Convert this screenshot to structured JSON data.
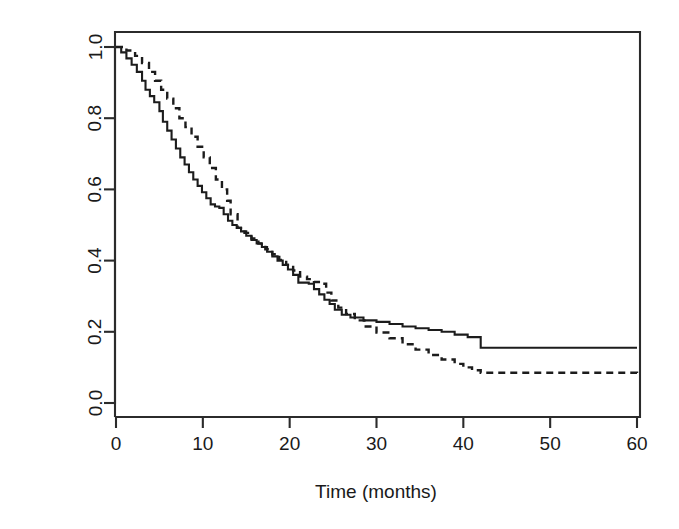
{
  "figure": {
    "background_color": "#ffffff",
    "foreground_color": "#1a1a1a"
  },
  "chart_data": {
    "type": "line",
    "subtype": "kaplan-meier-step",
    "title": "",
    "subtitle": "",
    "xlabel": "Time (months)",
    "ylabel": "Survival",
    "xlim": [
      0,
      60
    ],
    "ylim": [
      0.0,
      1.0
    ],
    "xticks": [
      0,
      10,
      20,
      30,
      40,
      50,
      60
    ],
    "xticklabels": [
      "0",
      "10",
      "20",
      "30",
      "40",
      "50",
      "60"
    ],
    "yticks": [
      0.0,
      0.2,
      0.4,
      0.6,
      0.8,
      1.0
    ],
    "yticklabels": [
      "0.0",
      "0.2",
      "0.4",
      "0.6",
      "0.8",
      "1.0"
    ],
    "grid": false,
    "legend": false,
    "legend_position": "none",
    "frame": "box",
    "series": [
      {
        "name": "Group 1",
        "style": "solid",
        "color": "#1c1c1c",
        "x": [
          0,
          0.6,
          1.2,
          1.8,
          2.4,
          3.0,
          3.4,
          3.9,
          4.4,
          5.0,
          5.4,
          5.9,
          6.4,
          6.9,
          7.4,
          7.9,
          8.4,
          8.9,
          9.4,
          9.9,
          10.4,
          10.9,
          11.4,
          11.9,
          12.4,
          12.9,
          13.4,
          13.9,
          14.4,
          15.0,
          15.6,
          16.2,
          16.8,
          17.4,
          18.0,
          18.6,
          19.2,
          19.8,
          20.4,
          21.0,
          22.2,
          22.8,
          23.4,
          24.0,
          24.6,
          25.2,
          26.0,
          27.0,
          28.5,
          30.0,
          31.5,
          33.0,
          34.5,
          36.0,
          37.5,
          39.0,
          40.5,
          42.0,
          60.0
        ],
        "y": [
          1.0,
          0.985,
          0.968,
          0.95,
          0.93,
          0.905,
          0.88,
          0.862,
          0.845,
          0.82,
          0.79,
          0.765,
          0.74,
          0.715,
          0.69,
          0.67,
          0.648,
          0.628,
          0.61,
          0.592,
          0.575,
          0.558,
          0.552,
          0.548,
          0.53,
          0.512,
          0.5,
          0.492,
          0.482,
          0.47,
          0.458,
          0.448,
          0.438,
          0.425,
          0.412,
          0.4,
          0.388,
          0.375,
          0.36,
          0.338,
          0.335,
          0.32,
          0.305,
          0.29,
          0.278,
          0.262,
          0.248,
          0.24,
          0.232,
          0.228,
          0.222,
          0.215,
          0.21,
          0.205,
          0.2,
          0.192,
          0.185,
          0.155,
          0.155
        ]
      },
      {
        "name": "Group 2",
        "style": "dashed",
        "color": "#1c1c1c",
        "x": [
          0,
          1.2,
          2.2,
          3.0,
          3.8,
          4.5,
          5.2,
          5.9,
          6.6,
          7.3,
          8.0,
          8.7,
          9.4,
          10.1,
          10.8,
          11.5,
          12.2,
          12.8,
          13.2,
          14.0,
          14.8,
          15.6,
          16.4,
          17.2,
          18.0,
          18.8,
          19.6,
          20.4,
          21.2,
          22.0,
          22.8,
          23.6,
          24.2,
          24.8,
          25.6,
          26.5,
          27.5,
          28.6,
          30.0,
          31.5,
          33.0,
          34.5,
          36.0,
          37.5,
          39.0,
          40.0,
          41.0,
          42.0,
          55.8,
          60.0
        ],
        "y": [
          1.0,
          0.99,
          0.975,
          0.955,
          0.93,
          0.905,
          0.88,
          0.855,
          0.828,
          0.8,
          0.775,
          0.748,
          0.72,
          0.69,
          0.66,
          0.628,
          0.6,
          0.568,
          0.53,
          0.492,
          0.478,
          0.462,
          0.448,
          0.432,
          0.418,
          0.402,
          0.388,
          0.372,
          0.355,
          0.348,
          0.34,
          0.335,
          0.31,
          0.288,
          0.268,
          0.25,
          0.232,
          0.215,
          0.198,
          0.182,
          0.165,
          0.15,
          0.135,
          0.122,
          0.11,
          0.1,
          0.092,
          0.085,
          0.085,
          0.072
        ]
      }
    ],
    "annotations": []
  },
  "axes": {
    "x_title": "Time (months)",
    "y_title": "Survival",
    "x_tick_labels": [
      "0",
      "10",
      "20",
      "30",
      "40",
      "50",
      "60"
    ],
    "y_tick_labels": [
      "0.0",
      "0.2",
      "0.4",
      "0.6",
      "0.8",
      "1.0"
    ]
  }
}
